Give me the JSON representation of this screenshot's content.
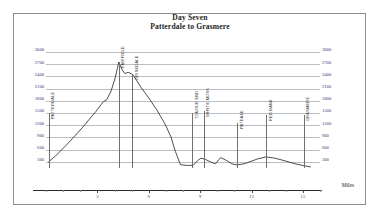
{
  "title": {
    "line1": "Day Seven",
    "line2": "Patterdale to Grasmere"
  },
  "axes": {
    "y_unit_note": "feet",
    "y_ticks": [
      3000,
      2700,
      2400,
      2100,
      1800,
      1500,
      1200,
      900,
      600,
      300
    ],
    "y_min": 0,
    "y_max": 3000,
    "x_label": "Miles",
    "x_ticks": [
      3,
      6,
      9,
      12,
      15
    ],
    "x_min": 0,
    "x_max": 16
  },
  "waypoints": [
    {
      "label": "PATTERDALE",
      "mile": 0.15,
      "top_ft": 1500
    },
    {
      "label": "FAIRFIELD",
      "mile": 4.25,
      "top_ft": 2750
    },
    {
      "label": "GRISEDALE",
      "mile": 5.05,
      "top_ft": 2450
    },
    {
      "label": "TONGUE END",
      "mile": 8.55,
      "top_ft": 1500
    },
    {
      "label": "WHYTE MOSS",
      "mile": 9.2,
      "top_ft": 1550
    },
    {
      "label": "PATDALE",
      "mile": 11.15,
      "top_ft": 1250
    },
    {
      "label": "RED BANK",
      "mile": 12.85,
      "top_ft": 1450
    },
    {
      "label": "GRASMERE",
      "mile": 15.05,
      "top_ft": 1450
    }
  ],
  "chart_data": {
    "type": "line",
    "xlabel": "Miles",
    "ylabel": "Elevation (feet)",
    "xlim": [
      0,
      16
    ],
    "ylim": [
      0,
      3000
    ],
    "grid": true,
    "legend": "none",
    "series": [
      {
        "name": "Elevation profile",
        "x": [
          0.15,
          0.55,
          1.3,
          2.1,
          2.9,
          3.35,
          3.55,
          3.8,
          4.05,
          4.25,
          4.45,
          4.6,
          4.8,
          5.05,
          5.25,
          5.55,
          6.0,
          6.45,
          6.95,
          7.3,
          7.55,
          7.85,
          8.25,
          8.6,
          8.85,
          9.05,
          9.3,
          9.6,
          9.9,
          10.2,
          10.55,
          10.85,
          11.15,
          11.5,
          11.9,
          12.35,
          12.85,
          13.35,
          13.9,
          14.55,
          15.05,
          15.45
        ],
        "y": [
          300,
          440,
          760,
          1130,
          1530,
          1780,
          1830,
          2040,
          2380,
          2750,
          2560,
          2470,
          2500,
          2450,
          2330,
          2130,
          1870,
          1590,
          1230,
          910,
          560,
          230,
          210,
          215,
          330,
          390,
          360,
          300,
          250,
          405,
          330,
          250,
          225,
          245,
          300,
          370,
          420,
          390,
          330,
          250,
          205,
          175
        ]
      }
    ],
    "annotations": [
      {
        "text": "PATTERDALE",
        "x": 0.15
      },
      {
        "text": "FAIRFIELD",
        "x": 4.25
      },
      {
        "text": "GRISEDALE",
        "x": 5.05
      },
      {
        "text": "TONGUE END",
        "x": 8.55
      },
      {
        "text": "WHYTE MOSS",
        "x": 9.2
      },
      {
        "text": "PATDALE",
        "x": 11.15
      },
      {
        "text": "RED BANK",
        "x": 12.85
      },
      {
        "text": "GRASMERE",
        "x": 15.05
      }
    ]
  },
  "style": {
    "line_color": "#3a3a3a",
    "grid_color": "#b9bec6",
    "axis_label_color": "#33406e",
    "frame_color": "#8d8d8d"
  }
}
